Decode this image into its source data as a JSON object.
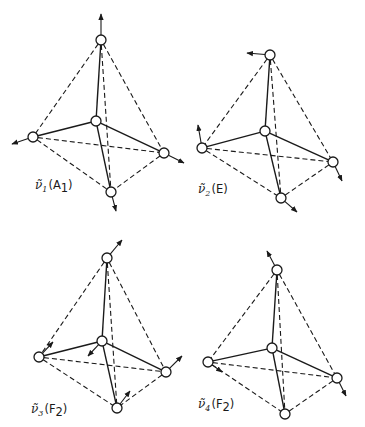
{
  "figure": {
    "colors": {
      "line": "#1a1a1a",
      "atom_fill": "#ffffff",
      "background": "#ffffff"
    },
    "panels": [
      {
        "id": "nu1",
        "label": {
          "symbol": "ν̃",
          "index": "1",
          "species": "A",
          "species_sub": "1",
          "x": 35,
          "y": 189
        },
        "vertices": {
          "top": [
            101,
            40
          ],
          "left": [
            33,
            137
          ],
          "center": [
            96,
            121
          ],
          "right": [
            164,
            153
          ],
          "bottom": [
            111,
            192
          ]
        },
        "arrows": [
          {
            "from": "top",
            "to": [
              101,
              14
            ]
          },
          {
            "from": "left",
            "to": [
              12,
              144
            ]
          },
          {
            "from": "right",
            "to": [
              184,
              163
            ]
          },
          {
            "from": "bottom",
            "to": [
              116,
              211
            ]
          }
        ]
      },
      {
        "id": "nu2",
        "label": {
          "symbol": "ν̃",
          "index": "2",
          "species": "E",
          "species_sub": "",
          "x": 198,
          "y": 193
        },
        "vertices": {
          "top": [
            270,
            55
          ],
          "left": [
            202,
            148
          ],
          "center": [
            265,
            131
          ],
          "right": [
            333,
            162
          ],
          "bottom": [
            281,
            198
          ]
        },
        "arrows": [
          {
            "from": "top",
            "to": [
              247,
              53
            ]
          },
          {
            "from": "left",
            "to": [
              198,
              125
            ]
          },
          {
            "from": "right",
            "to": [
              342,
              181
            ]
          },
          {
            "from": "bottom",
            "to": [
              297,
              212
            ]
          }
        ]
      },
      {
        "id": "nu3",
        "label": {
          "symbol": "ν̃",
          "index": "3",
          "species": "F",
          "species_sub": "2",
          "x": 31,
          "y": 413
        },
        "vertices": {
          "top": [
            107,
            258
          ],
          "left": [
            39,
            357
          ],
          "center": [
            102,
            341
          ],
          "right": [
            166,
            372
          ],
          "bottom": [
            117,
            408
          ]
        },
        "arrows": [
          {
            "from": "top",
            "to": [
              122,
              240
            ]
          },
          {
            "from": "left",
            "to": [
              53,
              342
            ]
          },
          {
            "from": "center",
            "to": [
              88,
              356
            ]
          },
          {
            "from": "right",
            "to": [
              182,
              356
            ]
          },
          {
            "from": "bottom",
            "to": [
              130,
              391
            ]
          }
        ]
      },
      {
        "id": "nu4",
        "label": {
          "symbol": "ν̃",
          "index": "4",
          "species": "F",
          "species_sub": "2",
          "x": 198,
          "y": 408
        },
        "vertices": {
          "top": [
            277,
            270
          ],
          "left": [
            208,
            362
          ],
          "center": [
            272,
            348
          ],
          "right": [
            337,
            378
          ],
          "bottom": [
            285,
            414
          ]
        },
        "arrows": [
          {
            "from": "top",
            "to": [
              267,
              251
            ]
          },
          {
            "from": "left",
            "to": [
              222,
              372
            ]
          },
          {
            "from": "right",
            "to": [
              346,
              396
            ]
          }
        ]
      }
    ]
  }
}
